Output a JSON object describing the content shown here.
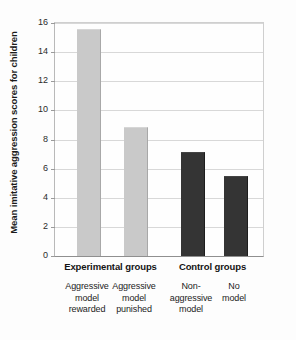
{
  "chart_data": {
    "type": "bar",
    "title": "",
    "xlabel": "",
    "ylabel": "Mean imitative aggression scores for children",
    "ylim": [
      0,
      16
    ],
    "ytick_labels": [
      "16",
      "14",
      "12",
      "10",
      "8",
      "6",
      "4",
      "2",
      "0"
    ],
    "yticks": [
      16,
      14,
      12,
      10,
      8,
      6,
      4,
      2,
      0
    ],
    "grid": "horizontal",
    "legend_position": "none",
    "categories": [
      "Aggressive model rewarded",
      "Aggressive model punished",
      "Non-aggressive model",
      "No model"
    ],
    "values": [
      15.5,
      8.8,
      7.1,
      5.4
    ],
    "bar_colors": [
      "#c9c9c9",
      "#c9c9c9",
      "#343434",
      "#343434"
    ],
    "groups": [
      {
        "label": "Experimental groups",
        "categories": [
          0,
          1
        ]
      },
      {
        "label": "Control groups",
        "categories": [
          2,
          3
        ]
      }
    ]
  },
  "bars": [
    {
      "value": 15.5,
      "style": "light",
      "label_lines": [
        "Aggressive",
        "model",
        "rewarded"
      ]
    },
    {
      "value": 8.8,
      "style": "light",
      "label_lines": [
        "Aggressive",
        "model",
        "punished"
      ]
    },
    {
      "value": 7.1,
      "style": "dark",
      "label_lines": [
        "Non-",
        "aggressive",
        "model"
      ]
    },
    {
      "value": 5.4,
      "style": "dark",
      "label_lines": [
        "No",
        "model"
      ]
    }
  ],
  "axes": {
    "y_title": "Mean imitative aggression scores for children",
    "y_tick_labels": [
      "16",
      "14",
      "12",
      "10",
      "8",
      "6",
      "4",
      "2",
      "0"
    ]
  },
  "groups": [
    {
      "label": "Experimental groups"
    },
    {
      "label": "Control groups"
    }
  ],
  "colors": {
    "bar_light": "#c9c9c9",
    "bar_dark": "#343434",
    "gridline": "#d8d8d8",
    "axis": "#8f8f8f",
    "text": "#1b1b1b",
    "background": "#fdfdfd"
  }
}
